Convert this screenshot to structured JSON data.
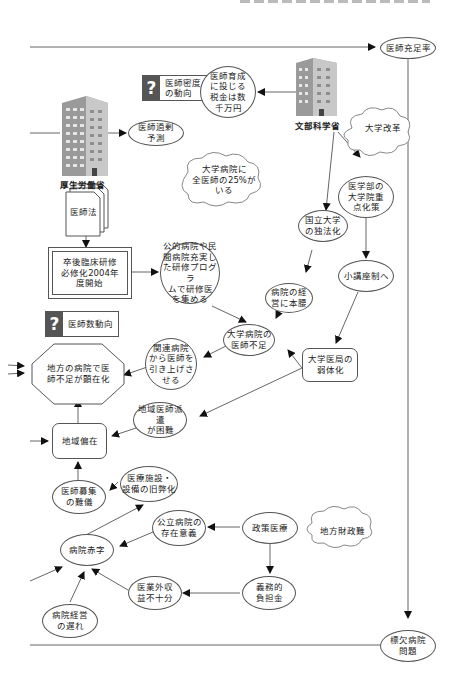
{
  "diagram": {
    "nodes": {
      "doctor_sufficiency": "医師充足率",
      "doctor_density": "医師密度\nの動向",
      "training_tax": "医師育成\nに投じる\n税金は数\n千万円",
      "mext": "文部科学省",
      "university_reform": "大学改革",
      "mhlw": "厚生労働省",
      "doctor_surplus_forecast": "医師過剰\n予測",
      "univ_hospital_25pct": "大学病院に\n全医師の25%が\nいる",
      "med_law": "医師法",
      "national_univ_incorp": "国立大学\nの独法化",
      "grad_school_focus": "医学部の\n大学院重\n点化策",
      "residency_2004": "卒後臨床研修\n必修化2004年\n度開始",
      "public_private_programs": "公的病院や民\n間病院充実し\nた研修プログラ\nムで研修医\nを集める",
      "hospital_management_focus": "病院の経\n営に本腰",
      "small_chair_system": "小講座制へ",
      "doctor_count_trend": "医師数動向",
      "univ_hospital_shortage": "大学病院の\n医師不足",
      "withdraw_doctors": "関連病院\nから医師を\n引き上げさ\nせる",
      "rural_shortage_visible": "地方の病院で医\n師不足が顕在化",
      "medical_office_weakening": "大学医局の\n弱体化",
      "regional_dispatch_difficult": "地域医師派遣\nが困難",
      "regional_maldistribution": "地域偏在",
      "recruitment_difficult": "医師募集\nの難儀",
      "facility_aging": "医療施設・\n設備の旧弊化",
      "public_hospital_purpose": "公立病院の\n存在意義",
      "policy_medicine": "政策医療",
      "local_finance_difficulty": "地方財政難",
      "hospital_deficit": "病院赤字",
      "non_medical_revenue": "医業外収\n益不十分",
      "obligatory_burden": "義務的\n負担金",
      "management_delay": "病院経営\nの遅れ",
      "hospital_shortage_issue": "標欠病院\n問題"
    },
    "colors": {
      "line": "#555555",
      "question_box": "#555555",
      "building": "#8a8a8a"
    }
  }
}
